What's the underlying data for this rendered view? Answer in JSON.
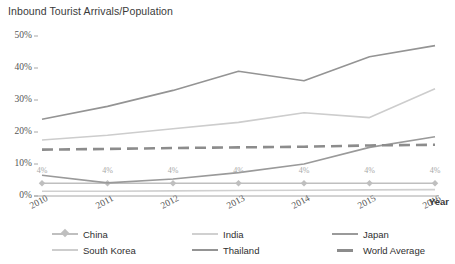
{
  "chart_data": {
    "type": "line",
    "title": "Inbound Tourist Arrivals/Population",
    "xlabel": "Year",
    "ylabel": "",
    "x": [
      2010,
      2011,
      2012,
      2013,
      2014,
      2015,
      2016
    ],
    "categories": [
      "2010",
      "2011",
      "2012",
      "2013",
      "2014",
      "2015",
      "2016"
    ],
    "ytick_labels": [
      "50%",
      "40%",
      "30%",
      "20%",
      "10%",
      "0%"
    ],
    "ytick_values": [
      50,
      40,
      30,
      20,
      10,
      0
    ],
    "ylim": [
      0,
      50
    ],
    "grid": false,
    "legend_position": "bottom",
    "series": [
      {
        "name": "China",
        "color": "#bfbfbf",
        "style": "solid",
        "marker": "diamond",
        "values": [
          4,
          4,
          4,
          4,
          4,
          4,
          4
        ],
        "data_labels": [
          "4%",
          "4%",
          "4%",
          "4%",
          "4%",
          "4%",
          "4%"
        ]
      },
      {
        "name": "India",
        "color": "#d0d0d0",
        "style": "solid",
        "marker": "none",
        "values": [
          1.5,
          1.5,
          1.6,
          1.7,
          1.8,
          1.9,
          2.0
        ]
      },
      {
        "name": "Japan",
        "color": "#9a9a9a",
        "style": "solid",
        "marker": "none",
        "values": [
          6.5,
          4.1,
          5.3,
          7.3,
          10.0,
          15.2,
          18.5
        ]
      },
      {
        "name": "South Korea",
        "color": "#cdcdcd",
        "style": "solid",
        "marker": "none",
        "values": [
          17.5,
          19.0,
          21.0,
          23.0,
          26.0,
          24.5,
          33.5
        ]
      },
      {
        "name": "Thailand",
        "color": "#949494",
        "style": "solid",
        "marker": "none",
        "values": [
          24.0,
          28.0,
          33.0,
          39.0,
          36.0,
          43.5,
          47.0
        ]
      },
      {
        "name": "World Average",
        "color": "#8c8c8c",
        "style": "dashed",
        "marker": "none",
        "values": [
          14.5,
          14.7,
          15.0,
          15.2,
          15.4,
          15.8,
          16.0
        ]
      }
    ]
  },
  "legend": {
    "items": [
      {
        "label": "China"
      },
      {
        "label": "India"
      },
      {
        "label": "Japan"
      },
      {
        "label": "South Korea"
      },
      {
        "label": "Thailand"
      },
      {
        "label": "World Average"
      }
    ]
  },
  "colors": {
    "axis": "#a6a6a6",
    "text": "#404040",
    "background": "#ffffff"
  }
}
